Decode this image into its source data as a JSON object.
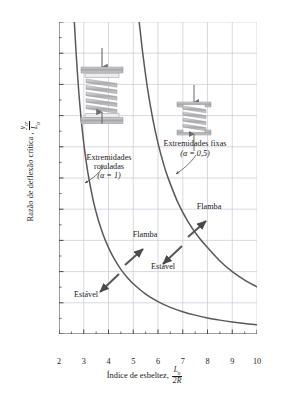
{
  "chart_data": {
    "type": "line",
    "title": "",
    "xlabel": "Índice de esbeltez, L0/2R",
    "ylabel": "Razão de deflexão crítica, ycr/L0",
    "xlim": [
      2,
      10
    ],
    "ylim": [
      0,
      1.0
    ],
    "xticks": [
      "2",
      "3",
      "4",
      "5",
      "6",
      "7",
      "8",
      "9",
      "10"
    ],
    "yticks": [
      "0",
      "0,1",
      "0,2",
      "0,3",
      "0,4",
      "0,5",
      "0,6",
      "0,7",
      "0,8",
      "0,9",
      "1,0"
    ],
    "grid": true,
    "legend_position": "none",
    "series": [
      {
        "name": "Extremidades rotuladas (alpha = 1)",
        "x": [
          2.62,
          2.7,
          2.8,
          2.9,
          3.0,
          3.1,
          3.2,
          3.4,
          3.6,
          3.8,
          4.0,
          4.25,
          4.5,
          4.75,
          5.0,
          5.5,
          6.0,
          6.5,
          7.0,
          7.5,
          8.0,
          8.5,
          9.0,
          9.5,
          10.0
        ],
        "y": [
          1.0,
          0.89,
          0.775,
          0.685,
          0.612,
          0.552,
          0.502,
          0.422,
          0.362,
          0.315,
          0.277,
          0.238,
          0.207,
          0.182,
          0.161,
          0.128,
          0.104,
          0.0855,
          0.0715,
          0.0605,
          0.0515,
          0.0445,
          0.0385,
          0.0335,
          0.0295
        ]
      },
      {
        "name": "Extremidades fixas (alpha = 0,5)",
        "x": [
          5.24,
          5.4,
          5.6,
          5.8,
          6.0,
          6.2,
          6.4,
          6.8,
          7.2,
          7.6,
          8.0,
          8.5,
          9.0,
          9.5,
          10.0
        ],
        "y": [
          1.0,
          0.89,
          0.775,
          0.685,
          0.612,
          0.552,
          0.502,
          0.422,
          0.362,
          0.315,
          0.277,
          0.234,
          0.2,
          0.173,
          0.151
        ]
      }
    ],
    "annotations": [
      {
        "text": "Extremidades rotuladas",
        "x": 3.9,
        "y": 0.6
      },
      {
        "text": "(α = 1)",
        "x": 3.9,
        "y": 0.545
      },
      {
        "text": "Extremidades fixas",
        "x": 7.4,
        "y": 0.545
      },
      {
        "text": "(α = 0,5)",
        "x": 7.4,
        "y": 0.49
      },
      {
        "text": "Flamba",
        "x": 5.1,
        "y": 0.255
      },
      {
        "text": "Estável",
        "x": 3.0,
        "y": 0.105
      },
      {
        "text": "Flamba",
        "x": 7.65,
        "y": 0.345
      },
      {
        "text": "Estável",
        "x": 6.55,
        "y": 0.195
      }
    ]
  },
  "axis": {
    "ylabel_text": "Razão de deflexão crítica ,",
    "ylabel_num": "y",
    "ylabel_num_sub": "cr",
    "ylabel_den": "L",
    "ylabel_den_sub": "o",
    "xlabel_text": "Índice de esbeltez,",
    "xlabel_num": "L",
    "xlabel_num_sub": "o",
    "xlabel_den": "2R"
  },
  "ticks": {
    "y": [
      "1,0",
      "0,9",
      "0,8",
      "0,7",
      "0,6",
      "0,5",
      "0,4",
      "0,3",
      "0,2",
      "0,1",
      "0"
    ],
    "x": [
      "2",
      "3",
      "4",
      "5",
      "6",
      "7",
      "8",
      "9",
      "10"
    ]
  },
  "annotations": {
    "pinned_line1": "Extremidades",
    "pinned_line2": "rotuladas",
    "pinned_alpha": "(α = 1)",
    "fixed_line1": "Extremidades fixas",
    "fixed_alpha": "(α = 0,5)",
    "buckles_left": "Flamba",
    "stable_left": "Estável",
    "buckles_right": "Flamba",
    "stable_right": "Estável"
  },
  "colors": {
    "curve": "#595959",
    "grid": "#c9c9d4",
    "axis": "#3a3a3a",
    "text": "#1a1a1a",
    "spring_body": "#b9b9bd",
    "spring_plate": "#a8a8ac"
  }
}
